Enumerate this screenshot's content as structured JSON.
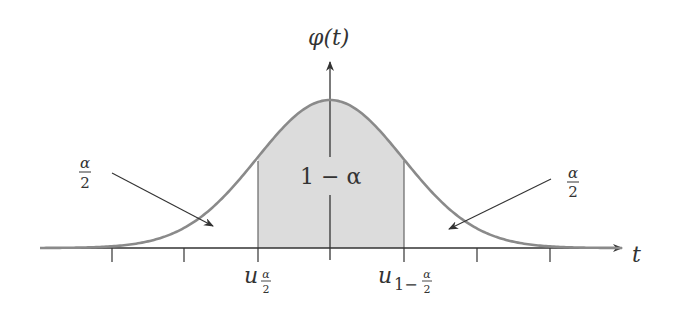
{
  "diagram": {
    "y_axis_label": "φ(t)",
    "x_axis_label": "t",
    "center_label": "1 − α",
    "left_tail_label": {
      "num": "α",
      "den": "2"
    },
    "right_tail_label": {
      "num": "α",
      "den": "2"
    },
    "lower_quantile_label": {
      "base": "u",
      "sub_num": "α",
      "sub_den": "2"
    },
    "upper_quantile_label": {
      "base": "u",
      "sub_prefix": "1−",
      "sub_num": "α",
      "sub_den": "2"
    },
    "colors": {
      "curve": "#8a8a8a",
      "shade": "#dcdcdc",
      "axis": "#333333",
      "text": "#333333"
    },
    "tick_count": 7
  }
}
